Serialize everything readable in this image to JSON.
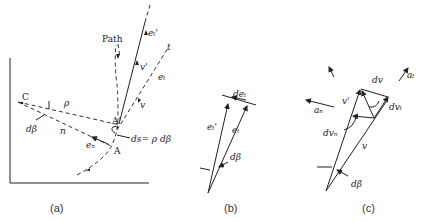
{
  "figure": {
    "panels": [
      {
        "id": "a",
        "caption": "(a)",
        "labels": {
          "path": "Path",
          "center": "C",
          "rho": "ρ",
          "dbeta": "dβ",
          "n": "n",
          "en": "eₙ",
          "point_a": "A",
          "point_a_prime": "A'",
          "ds": "ds= ρ dβ",
          "v": "v",
          "v_prime": "v'",
          "et": "eₜ",
          "et_prime": "eₜ'",
          "t": "t"
        }
      },
      {
        "id": "b",
        "caption": "(b)",
        "labels": {
          "det": "deₜ",
          "et_prime": "eₜ'",
          "et": "eₜ",
          "dbeta": "dβ"
        }
      },
      {
        "id": "c",
        "caption": "(c)",
        "labels": {
          "dv": "dv",
          "at": "aₜ",
          "an": "aₙ",
          "v_prime": "v'",
          "dvt": "dvₜ",
          "dvn": "dvₙ",
          "v": "v",
          "dbeta": "dβ"
        }
      }
    ]
  }
}
